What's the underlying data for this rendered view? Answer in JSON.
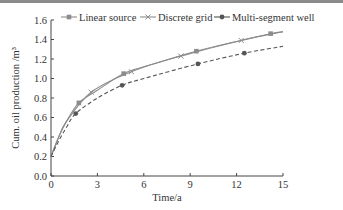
{
  "chart_data": {
    "type": "line",
    "title": "",
    "xlabel": "Time/a",
    "ylabel": "Cum. oil production /m³",
    "xlim": [
      0,
      15
    ],
    "ylim": [
      0.0,
      1.6
    ],
    "xticks": [
      "0",
      "3",
      "6",
      "9",
      "12",
      "15"
    ],
    "yticks": [
      "0.0",
      "0.2",
      "0.4",
      "0.6",
      "0.8",
      "1.0",
      "1.2",
      "1.4",
      "1.6"
    ],
    "grid": false,
    "legend_position": "top",
    "series": [
      {
        "name": "Linear source",
        "style": "solid",
        "marker": "square",
        "color": "#8c8c8c",
        "curve": [
          [
            0,
            0.2
          ],
          [
            0.5,
            0.4
          ],
          [
            1,
            0.56
          ],
          [
            1.8,
            0.75
          ],
          [
            3,
            0.88
          ],
          [
            4.7,
            1.05
          ],
          [
            6,
            1.12
          ],
          [
            9.4,
            1.28
          ],
          [
            12,
            1.38
          ],
          [
            14.2,
            1.46
          ],
          [
            15,
            1.48
          ]
        ],
        "markers": [
          [
            1.8,
            0.75
          ],
          [
            4.7,
            1.05
          ],
          [
            9.4,
            1.28
          ],
          [
            14.2,
            1.46
          ]
        ]
      },
      {
        "name": "Discrete grid",
        "style": "solid",
        "marker": "cross",
        "color": "#8c8c8c",
        "curve": [
          [
            0,
            0.2
          ],
          [
            0.5,
            0.4
          ],
          [
            1,
            0.56
          ],
          [
            2.6,
            0.86
          ],
          [
            5.2,
            1.07
          ],
          [
            8.4,
            1.23
          ],
          [
            12.3,
            1.39
          ],
          [
            15,
            1.48
          ]
        ],
        "markers": [
          [
            2.6,
            0.86
          ],
          [
            5.2,
            1.07
          ],
          [
            8.4,
            1.23
          ],
          [
            12.3,
            1.39
          ]
        ]
      },
      {
        "name": "Multi-segment well",
        "style": "dashed",
        "marker": "circle",
        "color": "#555555",
        "curve": [
          [
            0,
            0.2
          ],
          [
            0.5,
            0.36
          ],
          [
            1,
            0.5
          ],
          [
            1.6,
            0.64
          ],
          [
            3,
            0.8
          ],
          [
            4.6,
            0.93
          ],
          [
            6,
            1.0
          ],
          [
            9.5,
            1.15
          ],
          [
            12.5,
            1.26
          ],
          [
            15,
            1.33
          ]
        ],
        "markers": [
          [
            1.6,
            0.64
          ],
          [
            4.6,
            0.93
          ],
          [
            9.5,
            1.15
          ],
          [
            12.5,
            1.26
          ]
        ]
      }
    ]
  }
}
